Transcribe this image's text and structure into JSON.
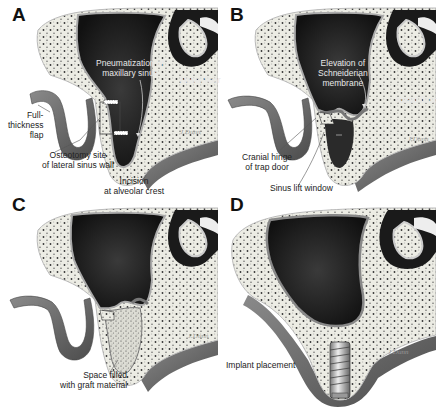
{
  "figure": {
    "panels": [
      {
        "id": "A",
        "labels": {
          "pneumatization_line1": "Pneumatization of",
          "pneumatization_line2": "maxillary sinus",
          "nasal_floor": "Nasal floor",
          "flap_line1": "Full-",
          "flap_line2": "thickness",
          "flap_line3": "flap",
          "osteotomy_line1": "Osteotomy site",
          "osteotomy_line2": "of lateral sinus wall",
          "incision_line1": "Incision",
          "incision_line2": "at alveolar crest"
        }
      },
      {
        "id": "B",
        "labels": {
          "elevation_line1": "Elevation of",
          "elevation_line2": "Schneiderian",
          "elevation_line3": "membrane",
          "nasal_floor": "Nasal floor",
          "hinge_line1": "Cranial hinge",
          "hinge_line2": "of trap door",
          "window": "Sinus lift window"
        }
      },
      {
        "id": "C",
        "labels": {
          "graft_line1": "Space filled",
          "graft_line2": "with graft material"
        }
      },
      {
        "id": "D",
        "labels": {
          "implant": "Implant placement"
        }
      }
    ],
    "signature": "J.Dunn",
    "colors": {
      "sinus": "#1c1c1c",
      "bone": "#efefe8",
      "mucosa": "#6e6e6e",
      "background": "#ffffff"
    }
  }
}
